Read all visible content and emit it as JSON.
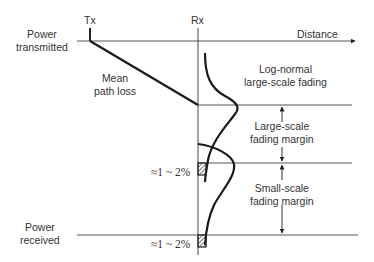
{
  "diagram": {
    "tx_label": "Tx",
    "rx_label": "Rx",
    "distance_label": "Distance",
    "power_transmitted": [
      "Power",
      "transmitted"
    ],
    "power_received": [
      "Power",
      "received"
    ],
    "mean_path_loss": [
      "Mean",
      "path loss"
    ],
    "lognormal_fading": [
      "Log-normal",
      "large-scale fading"
    ],
    "large_scale_margin": [
      "Large-scale",
      "fading margin"
    ],
    "small_scale_margin": [
      "Small-scale",
      "fading margin"
    ],
    "outage_upper": "≈1 ~ 2%",
    "outage_lower": "≈1 ~ 2%",
    "line_color": "#1a1a1a"
  }
}
